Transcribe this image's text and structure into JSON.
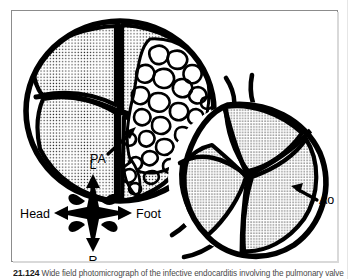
{
  "figure": {
    "panel_name": "anatomical-line-drawing",
    "background_color": "#ffffff",
    "ink_color": "#000000",
    "frame_color": "#8c8c8c",
    "labels": {
      "pa": "PA",
      "ao": "Ao"
    },
    "orientation_compass": {
      "top": "L",
      "bottom": "R",
      "left": "Head",
      "right": "Foot"
    },
    "structures": [
      {
        "name": "pulmonary-valve",
        "label": "PA",
        "cusp_count": 3,
        "fill": "stipple",
        "finding": "vegetation on one cusp"
      },
      {
        "name": "aortic-valve",
        "label": "Ao",
        "cusp_count": 3,
        "fill": "stipple",
        "finding": "normal"
      }
    ]
  },
  "caption": {
    "number": "21.124",
    "text": "Wide field photomicrograph of the infective endocarditis involving the pulmonary valve"
  }
}
